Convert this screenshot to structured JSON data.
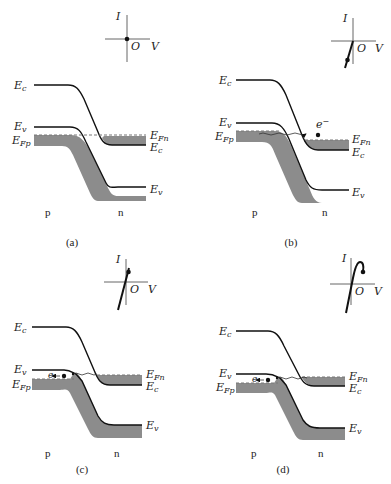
{
  "figure": {
    "panels": [
      {
        "id": "a",
        "caption": "(a)",
        "labels": {
          "Ec_left": "E",
          "Ec_left_sub": "c",
          "Ev_left": "E",
          "Ev_left_sub": "v",
          "EFp": "E",
          "EFp_sub": "Fp",
          "EFn": "E",
          "EFn_sub": "Fn",
          "Ec_right": "E",
          "Ec_right_sub": "c",
          "Ev_right": "E",
          "Ev_right_sub": "v",
          "p": "p",
          "n": "n"
        },
        "iv": {
          "I": "I",
          "O": "O",
          "V": "V",
          "operating_point": "origin (zero bias)"
        },
        "tunneling": null
      },
      {
        "id": "b",
        "caption": "(b)",
        "labels": {
          "Ec_left": "E",
          "Ec_left_sub": "c",
          "Ev_left": "E",
          "Ev_left_sub": "v",
          "EFp": "E",
          "EFp_sub": "Fp",
          "EFn": "E",
          "EFn_sub": "Fn",
          "Ec_right": "E",
          "Ec_right_sub": "c",
          "Ev_right": "E",
          "Ev_right_sub": "v",
          "p": "p",
          "n": "n"
        },
        "iv": {
          "I": "I",
          "O": "O",
          "V": "V",
          "operating_point": "reverse bias"
        },
        "tunneling": {
          "carrier": "e",
          "charge": "−",
          "direction": "p to n"
        }
      },
      {
        "id": "c",
        "caption": "(c)",
        "labels": {
          "Ec_left": "E",
          "Ec_left_sub": "c",
          "Ev_left": "E",
          "Ev_left_sub": "v",
          "EFp": "E",
          "EFp_sub": "Fp",
          "EFn": "E",
          "EFn_sub": "Fn",
          "Ec_right": "E",
          "Ec_right_sub": "c",
          "Ev_right": "E",
          "Ev_right_sub": "v",
          "p": "p",
          "n": "n"
        },
        "iv": {
          "I": "I",
          "O": "O",
          "V": "V",
          "operating_point": "small forward bias"
        },
        "tunneling": {
          "carrier": "e",
          "charge": "−",
          "direction": "n to p"
        }
      },
      {
        "id": "d",
        "caption": "(d)",
        "labels": {
          "Ec_left": "E",
          "Ec_left_sub": "c",
          "Ev_left": "E",
          "Ev_left_sub": "v",
          "EFp": "E",
          "EFp_sub": "Fp",
          "EFn": "E",
          "EFn_sub": "Fn",
          "Ec_right": "E",
          "Ec_right_sub": "c",
          "Ev_right": "E",
          "Ev_right_sub": "v",
          "p": "p",
          "n": "n"
        },
        "iv": {
          "I": "I",
          "O": "O",
          "V": "V",
          "operating_point": "peak current (forward bias)"
        },
        "tunneling": {
          "carrier": "e",
          "charge": "−",
          "direction": "n to p"
        }
      }
    ]
  }
}
